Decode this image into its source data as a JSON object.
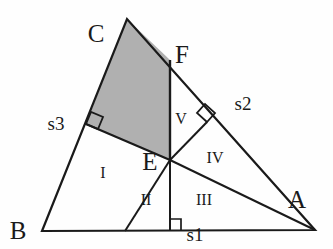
{
  "figure": {
    "background_color": "#fefefe",
    "stroke_color": "#1a1a1a",
    "shade_color": "#b0b0b0",
    "vertices": {
      "A": {
        "label": "A",
        "x": 315,
        "y": 230,
        "label_x": 292,
        "label_y": 206
      },
      "B": {
        "label": "B",
        "x": 42,
        "y": 231,
        "label_x": 18,
        "label_y": 239
      },
      "C": {
        "label": "C",
        "x": 127,
        "y": 19,
        "label_x": 96,
        "label_y": 42
      },
      "E": {
        "label": "E",
        "x": 170,
        "y": 160,
        "label_x": 141,
        "label_y": 170
      },
      "F": {
        "label": "F",
        "x": 170,
        "y": 60,
        "label_x": 174,
        "label_y": 62
      }
    },
    "feet": {
      "on_BC": {
        "x": 86,
        "y": 124
      },
      "on_CA": {
        "x": 207,
        "y": 122
      },
      "on_AB": {
        "x": 170,
        "y": 231
      },
      "cevian_base": {
        "x": 125,
        "y": 231
      }
    },
    "side_labels": [
      {
        "name": "s1",
        "text": "s1",
        "x": 183,
        "y": 238
      },
      {
        "name": "s2",
        "text": "s2",
        "x": 228,
        "y": 107
      },
      {
        "name": "s3",
        "text": "s3",
        "x": 43,
        "y": 129
      }
    ],
    "region_labels": [
      {
        "name": "region-I",
        "text": "I",
        "x": 100,
        "y": 178
      },
      {
        "name": "region-II",
        "text": "II",
        "x": 140,
        "y": 204
      },
      {
        "name": "region-III",
        "text": "III",
        "x": 196,
        "y": 204
      },
      {
        "name": "region-IV",
        "text": "IV",
        "x": 207,
        "y": 162
      },
      {
        "name": "region-V",
        "text": "V",
        "x": 176,
        "y": 124
      }
    ]
  }
}
